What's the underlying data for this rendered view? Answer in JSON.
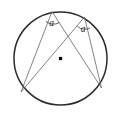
{
  "figure": {
    "kind": "geometry-diagram",
    "background_color": "#ffffff",
    "stroke_color_circle": "#2b2b2b",
    "stroke_color_chord": "#6e6e6e",
    "label_color": "#1a1a1a",
    "circle": {
      "center_x": 60.5,
      "center_y": 58.5,
      "radius": 46.5,
      "stroke_width": 1.5
    },
    "center_dot": {
      "x": 60.5,
      "y": 58.5,
      "size": 3.2,
      "color": "#000000"
    },
    "points": {
      "vertex_left": {
        "x": 52.0,
        "y": 11.6
      },
      "vertex_right": {
        "x": 84.5,
        "y": 17.0
      },
      "arc_end_left": {
        "x": 21.0,
        "y": 92.0
      },
      "arc_end_right": {
        "x": 101.5,
        "y": 88.0
      }
    },
    "chords": [
      {
        "name": "left-vertex-to-left-end",
        "x1": 52.0,
        "y1": 11.6,
        "x2": 21.0,
        "y2": 92.0
      },
      {
        "name": "left-vertex-to-right-end",
        "x1": 52.0,
        "y1": 11.6,
        "x2": 101.5,
        "y2": 88.0
      },
      {
        "name": "right-vertex-to-left-end",
        "x1": 84.5,
        "y1": 17.0,
        "x2": 21.0,
        "y2": 92.0
      },
      {
        "name": "right-vertex-to-right-end",
        "x1": 84.5,
        "y1": 17.0,
        "x2": 101.5,
        "y2": 88.0
      }
    ],
    "angle_arcs": [
      {
        "name": "angle-arc-left",
        "path": "M 45.9 21.3 A 11.5 11.5 0 0 0 59.3 22.6"
      },
      {
        "name": "angle-arc-right",
        "path": "M 77.4 26.2 A 10.5 10.5 0 0 0 89.9 27.9"
      }
    ],
    "labels": {
      "angle_left": "a",
      "angle_right": "a",
      "angle_left_x": 51.5,
      "angle_left_y": 26.0,
      "angle_right_x": 83.0,
      "angle_right_y": 31.5
    }
  }
}
